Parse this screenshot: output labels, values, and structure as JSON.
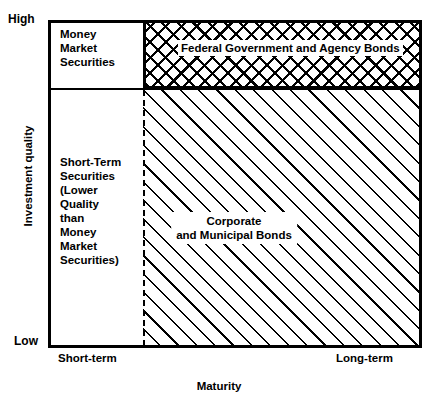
{
  "chart_data": {
    "type": "diagram",
    "title": "",
    "xlabel": "Maturity",
    "ylabel": "Investment quality",
    "x_ticks": [
      "Short-term",
      "Long-term"
    ],
    "y_ticks": [
      "Low",
      "High"
    ],
    "grid": false,
    "legend": "none",
    "regions": [
      {
        "name": "money-market-securities",
        "label": "Money\nMarket\nSecurities",
        "fill": "none",
        "x_range": [
          "Short-term",
          "Short-term"
        ],
        "y_range": [
          "high-mid",
          "High"
        ]
      },
      {
        "name": "federal-government-and-agency-bonds",
        "label": "Federal Government and Agency Bonds",
        "fill": "cross-hatch",
        "x_range": [
          "Short-term",
          "Long-term"
        ],
        "y_range": [
          "high-mid",
          "High"
        ]
      },
      {
        "name": "short-term-securities-lower-quality",
        "label": "Short-Term\nSecurities\n(Lower\nQuality\nthan\nMoney\nMarket\nSecurities)",
        "fill": "none",
        "x_range": [
          "Short-term",
          "Short-term"
        ],
        "y_range": [
          "Low",
          "high-mid"
        ]
      },
      {
        "name": "corporate-and-municipal-bonds",
        "label": "Corporate and Municipal Bonds",
        "fill": "diagonal-hatch",
        "x_range": [
          "Short-term",
          "Long-term"
        ],
        "y_range": [
          "Low",
          "high-mid"
        ]
      }
    ]
  },
  "axes": {
    "y_label": "Investment quality",
    "y_high": "High",
    "y_low": "Low",
    "x_label": "Maturity",
    "x_short": "Short-term",
    "x_long": "Long-term"
  },
  "regions": {
    "money_market": {
      "line1": "Money",
      "line2": "Market",
      "line3": "Securities"
    },
    "federal": {
      "label": "Federal Government and Agency Bonds"
    },
    "short_term": {
      "line1": "Short-Term",
      "line2": "Securities",
      "line3": "(Lower",
      "line4": "Quality",
      "line5": "than",
      "line6": "Money",
      "line7": "Market",
      "line8": "Securities)"
    },
    "corporate": {
      "line1": "Corporate",
      "line2": "and Municipal Bonds"
    }
  },
  "colors": {
    "ink": "#000000",
    "paper": "#ffffff"
  }
}
